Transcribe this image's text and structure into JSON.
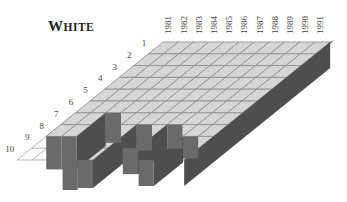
{
  "title": "WHITE",
  "chart_data": {
    "type": "heatmap",
    "title": "WHITE",
    "style": "3d-isometric-grid",
    "x": [
      "1981",
      "1982",
      "1983",
      "1984",
      "1985",
      "1986",
      "1987",
      "1988",
      "1989",
      "1990",
      "1991"
    ],
    "y": [
      "1",
      "2",
      "3",
      "4",
      "5",
      "6",
      "7",
      "8",
      "9",
      "10"
    ],
    "column_depth_rows": [
      8,
      8,
      6,
      10,
      10,
      7,
      9,
      7,
      10,
      8,
      10
    ],
    "hang_heights_px": [
      33,
      33,
      30,
      30,
      28,
      26,
      26,
      24,
      26,
      22,
      0
    ],
    "colors": {
      "top": "#d6d6d6",
      "grid": "#8a8a8a",
      "front": "#6a6a6a",
      "side": "#4e4e4e",
      "floor_line": "#9a9a9a"
    },
    "legend": null,
    "grid": true
  }
}
